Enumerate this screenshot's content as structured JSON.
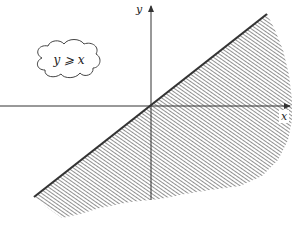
{
  "diagram": {
    "cloud_label": "y ⩾ x",
    "axes": {
      "x_label": "x",
      "y_label": "y"
    },
    "boundary_line": "y = x",
    "shaded_region": "below the line y = x (hatched)",
    "colors": {
      "line": "#333333",
      "hatch": "#555555",
      "axis": "#333333",
      "background": "#ffffff"
    }
  }
}
